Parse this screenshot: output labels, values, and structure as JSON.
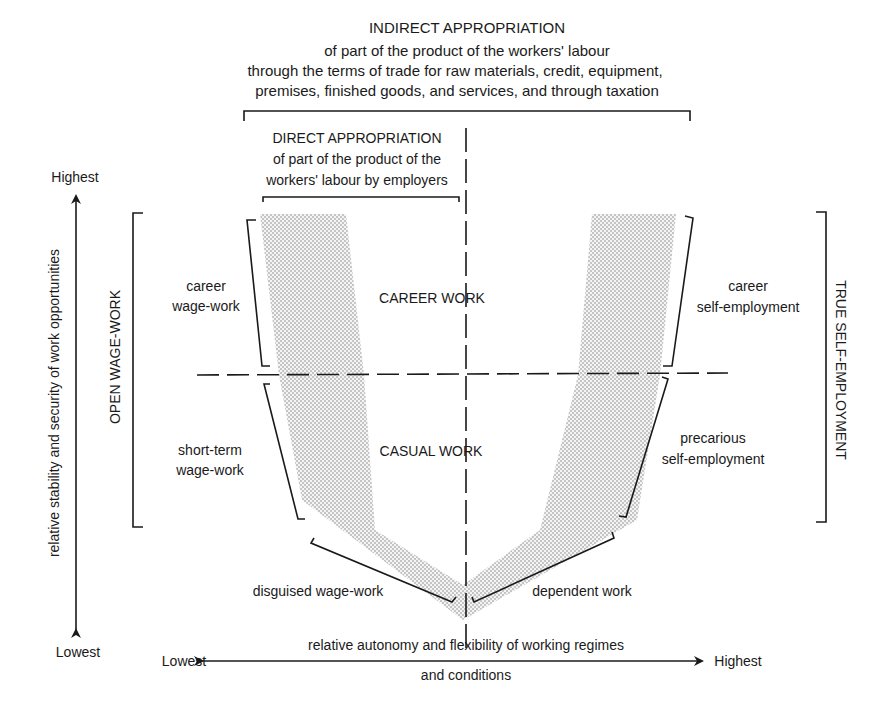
{
  "indirect": {
    "title": "INDIRECT APPROPRIATION",
    "line1": "of part of the product of the workers' labour",
    "line2": "through the terms of trade for raw materials, credit, equipment,",
    "line3": "premises, finished goods, and services, and through taxation"
  },
  "direct": {
    "title": "DIRECT APPROPRIATION",
    "line1": "of part of the product of the",
    "line2": "workers' labour by employers"
  },
  "y_axis": {
    "label": "relative stability and security of work opportunities",
    "top": "Highest",
    "bottom": "Lowest"
  },
  "x_axis": {
    "line1": "relative autonomy and flexibility of working regimes",
    "line2": "and conditions",
    "left": "Lowest",
    "right": "Highest"
  },
  "groups": {
    "left": "OPEN WAGE-WORK",
    "right": "TRUE SELF-EMPLOYMENT"
  },
  "zones": {
    "upper": "CAREER WORK",
    "lower": "CASUAL WORK"
  },
  "categories": {
    "career_wage": [
      "career",
      "wage-work"
    ],
    "short_term_wage": [
      "short-term",
      "wage-work"
    ],
    "disguised_wage": "disguised wage-work",
    "dependent": "dependent work",
    "precarious_self": [
      "precarious",
      "self-employment"
    ],
    "career_self": [
      "career",
      "self-employment"
    ]
  },
  "colors": {
    "ink": "#1a1a1a",
    "shade_dot": "#8a8a8a",
    "background": "#ffffff"
  }
}
